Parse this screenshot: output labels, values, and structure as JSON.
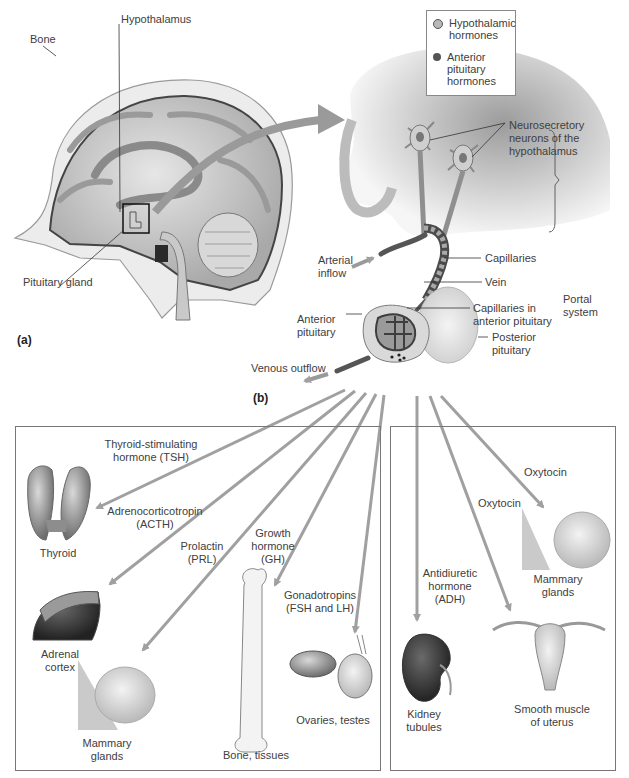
{
  "legend": {
    "items": [
      {
        "icon": "hatched-circle-icon",
        "label_line1": "Hypothalamic",
        "label_line2": "hormones",
        "color": "#9a9a9a"
      },
      {
        "icon": "filled-circle-icon",
        "label_line1": "Anterior",
        "label_line2": "pituitary",
        "label_line3": "hormones",
        "color": "#555555"
      }
    ]
  },
  "panel_a": {
    "letter": "(a)",
    "labels": {
      "bone": "Bone",
      "hypothalamus": "Hypothalamus",
      "pituitary_gland": "Pituitary gland"
    }
  },
  "panel_b": {
    "letter": "(b)",
    "labels": {
      "neurosecretory_1": "Neurosecretory",
      "neurosecretory_2": "neurons of the",
      "neurosecretory_3": "hypothalamus",
      "arterial_1": "Arterial",
      "arterial_2": "inflow",
      "capillaries": "Capillaries",
      "vein": "Vein",
      "cap_ant_1": "Capillaries in",
      "cap_ant_2": "anterior pituitary",
      "portal_1": "Portal",
      "portal_2": "system",
      "anterior_1": "Anterior",
      "anterior_2": "pituitary",
      "posterior_1": "Posterior",
      "posterior_2": "pituitary",
      "venous": "Venous outflow"
    }
  },
  "anterior_targets": {
    "hormones": [
      {
        "line1": "Thyroid-stimulating",
        "line2": "hormone (TSH)"
      },
      {
        "line1": "Adrenocorticotropin",
        "line2": "(ACTH)"
      },
      {
        "line1": "Prolactin",
        "line2": "(PRL)"
      },
      {
        "line1": "Growth",
        "line2": "hormone",
        "line3": "(GH)"
      },
      {
        "line1": "Gonadotropins",
        "line2": "(FSH and LH)"
      }
    ],
    "organs": [
      {
        "line1": "Thyroid"
      },
      {
        "line1": "Adrenal",
        "line2": "cortex"
      },
      {
        "line1": "Mammary",
        "line2": "glands"
      },
      {
        "line1": "Bone, tissues"
      },
      {
        "line1": "Ovaries, testes"
      }
    ]
  },
  "posterior_targets": {
    "hormones": [
      {
        "line1": "Antidiuretic",
        "line2": "hormone",
        "line3": "(ADH)"
      },
      {
        "line1": "Oxytocin"
      },
      {
        "line1": "Oxytocin"
      }
    ],
    "organs": [
      {
        "line1": "Kidney",
        "line2": "tubules"
      },
      {
        "line1": "Smooth muscle",
        "line2": "of uterus"
      },
      {
        "line1": "Mammary",
        "line2": "glands"
      }
    ]
  },
  "colors": {
    "arrow": "#a0a0a0",
    "outline": "#777777",
    "tissue": "#c8c8c8",
    "dark_tissue": "#4a4a4a"
  }
}
